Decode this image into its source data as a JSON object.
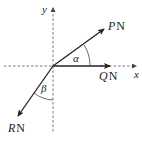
{
  "diagram": {
    "type": "force-diagram",
    "axes": {
      "x_label": "x",
      "y_label": "y"
    },
    "forces": [
      {
        "id": "P",
        "symbol": "P",
        "unit": "N",
        "direction": "up-right, angle α above the positive x-axis"
      },
      {
        "id": "Q",
        "symbol": "Q",
        "unit": "N",
        "direction": "along the positive x-axis"
      },
      {
        "id": "R",
        "symbol": "R",
        "unit": "N",
        "direction": "down-left, angle β from the negative y-axis"
      }
    ],
    "angles": [
      {
        "symbol": "α",
        "between": "P and positive x-axis"
      },
      {
        "symbol": "β",
        "between": "R and negative y-axis"
      }
    ],
    "colors": {
      "line": "#222222",
      "axis": "#555555"
    }
  }
}
